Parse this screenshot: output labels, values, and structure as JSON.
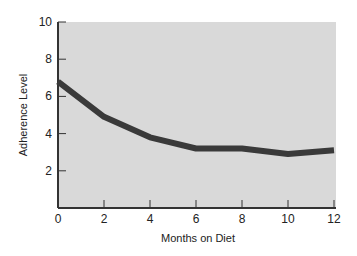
{
  "chart_data": {
    "type": "line",
    "title": "",
    "xlabel": "Months on Diet",
    "ylabel": "Adherence Level",
    "x": [
      0,
      2,
      4,
      6,
      8,
      10,
      12
    ],
    "series": [
      {
        "name": "Adherence",
        "values": [
          6.8,
          4.9,
          3.8,
          3.2,
          3.2,
          2.9,
          3.1
        ]
      }
    ],
    "xticks": [
      "0",
      "2",
      "4",
      "6",
      "8",
      "10",
      "12"
    ],
    "yticks": [
      "2",
      "4",
      "6",
      "8",
      "10"
    ],
    "xlim": [
      0,
      12
    ],
    "ylim": [
      0,
      10
    ],
    "grid": false,
    "legend": "none",
    "colors": {
      "plot_bg": "#d9d9d9",
      "line": "#3a3a3a",
      "axis": "#333333"
    }
  }
}
